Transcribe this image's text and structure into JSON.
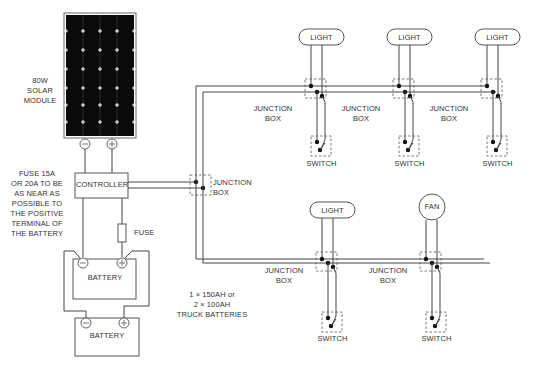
{
  "diagram": {
    "type": "solar-wiring-diagram",
    "solar_module": {
      "label": "80W\nSOLAR\nMODULE",
      "terminals": [
        "−",
        "+"
      ]
    },
    "controller": {
      "label": "CONTROLLER"
    },
    "fuse_note": {
      "label": "FUSE 15A\nOR 20A TO BE\nAS NEAR AS\nPOSSIBLE TO\nTHE POSITIVE\nTERMINAL OF\nTHE BATTERY"
    },
    "fuse": {
      "label": "FUSE"
    },
    "batteries": [
      {
        "label": "BATTERY",
        "terminals": [
          "−",
          "+"
        ]
      },
      {
        "label": "BATTERY",
        "terminals": [
          "−",
          "+"
        ]
      }
    ],
    "battery_note": {
      "label": "1 × 150AH or\n2 × 100AH\nTRUCK BATTERIES"
    },
    "main_junction": {
      "label": "JUNCTION\nBOX"
    },
    "upper_circuit": [
      {
        "load": "LIGHT",
        "junction": "JUNCTION\nBOX",
        "switch": "SWITCH"
      },
      {
        "load": "LIGHT",
        "junction": "JUNCTION\nBOX",
        "switch": "SWITCH"
      },
      {
        "load": "LIGHT",
        "junction": "JUNCTION\nBOX",
        "switch": "SWITCH"
      }
    ],
    "lower_circuit": [
      {
        "load": "LIGHT",
        "junction": "JUNCTION\nBOX",
        "switch": "SWITCH"
      },
      {
        "load": "FAN",
        "junction": "JUNCTION\nBOX",
        "switch": "SWITCH"
      }
    ],
    "colors": {
      "wire": "#444444",
      "panel": "#0a0a0a",
      "text": "#333333"
    }
  }
}
